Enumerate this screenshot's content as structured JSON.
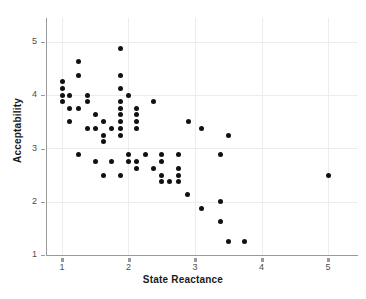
{
  "chart_data": {
    "type": "scatter",
    "title": "",
    "xlabel": "State Reactance",
    "ylabel": "Acceptability",
    "xlim": [
      0.78,
      5.2
    ],
    "ylim": [
      0.9,
      5.3
    ],
    "xticks": [
      1,
      2,
      3,
      4,
      5
    ],
    "yticks": [
      1,
      2,
      3,
      4,
      5
    ],
    "xticklabels": [
      "1",
      "2",
      "3",
      "4",
      "5"
    ],
    "yticklabels": [
      "1",
      "2",
      "3",
      "4",
      "5"
    ],
    "grid": true,
    "grid_color": "#ececec",
    "legend": "none",
    "marker": "circle",
    "marker_color": "#111111",
    "marker_size": 5,
    "n_points": 86,
    "points": [
      [
        1.0,
        4.25
      ],
      [
        1.0,
        4.12
      ],
      [
        1.0,
        4.0
      ],
      [
        1.0,
        3.88
      ],
      [
        1.12,
        4.0
      ],
      [
        1.12,
        3.75
      ],
      [
        1.12,
        3.5
      ],
      [
        1.25,
        4.63
      ],
      [
        1.25,
        4.38
      ],
      [
        1.25,
        3.75
      ],
      [
        1.25,
        2.88
      ],
      [
        1.38,
        4.0
      ],
      [
        1.38,
        3.88
      ],
      [
        1.38,
        3.38
      ],
      [
        1.5,
        3.63
      ],
      [
        1.5,
        3.38
      ],
      [
        1.5,
        2.75
      ],
      [
        1.62,
        3.5
      ],
      [
        1.62,
        3.25
      ],
      [
        1.62,
        3.13
      ],
      [
        1.62,
        2.5
      ],
      [
        1.75,
        3.38
      ],
      [
        1.75,
        2.75
      ],
      [
        1.88,
        4.88
      ],
      [
        1.88,
        4.38
      ],
      [
        1.88,
        4.13
      ],
      [
        1.88,
        3.88
      ],
      [
        1.88,
        3.75
      ],
      [
        1.88,
        3.63
      ],
      [
        1.88,
        3.5
      ],
      [
        1.88,
        3.38
      ],
      [
        1.88,
        3.25
      ],
      [
        1.88,
        2.5
      ],
      [
        2.0,
        4.0
      ],
      [
        2.0,
        2.88
      ],
      [
        2.0,
        2.75
      ],
      [
        2.12,
        3.75
      ],
      [
        2.12,
        3.63
      ],
      [
        2.12,
        3.5
      ],
      [
        2.12,
        3.38
      ],
      [
        2.12,
        2.75
      ],
      [
        2.12,
        2.63
      ],
      [
        2.25,
        2.88
      ],
      [
        2.38,
        3.88
      ],
      [
        2.38,
        2.63
      ],
      [
        2.5,
        2.88
      ],
      [
        2.5,
        2.75
      ],
      [
        2.5,
        2.5
      ],
      [
        2.5,
        2.38
      ],
      [
        2.62,
        2.38
      ],
      [
        2.75,
        2.88
      ],
      [
        2.75,
        2.63
      ],
      [
        2.75,
        2.5
      ],
      [
        2.75,
        2.38
      ],
      [
        2.88,
        2.13
      ],
      [
        2.9,
        3.5
      ],
      [
        3.1,
        3.38
      ],
      [
        3.1,
        1.88
      ],
      [
        3.38,
        2.88
      ],
      [
        3.38,
        2.0
      ],
      [
        3.38,
        1.63
      ],
      [
        3.5,
        3.25
      ],
      [
        3.5,
        1.25
      ],
      [
        3.75,
        1.25
      ],
      [
        5.0,
        2.5
      ]
    ]
  },
  "axis": {
    "x_label": "State Reactance",
    "y_label": "Acceptability"
  }
}
